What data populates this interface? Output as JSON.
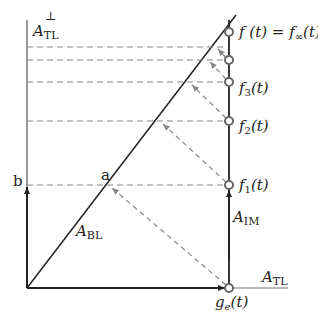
{
  "diagram": {
    "axes": {
      "vertical_label_main": "A",
      "vertical_label_sub": "TL",
      "vertical_label_sup": "⊥",
      "horizontal_label_main": "A",
      "horizontal_label_sub": "TL"
    },
    "lines": {
      "diagonal_label_main": "A",
      "diagonal_label_sub": "BL",
      "right_vertical_label_main": "A",
      "right_vertical_label_sub": "IM"
    },
    "points": {
      "a": "a",
      "b": "b",
      "ge": "g",
      "ge_sub": "e",
      "ge_arg": "(t)",
      "f1": "f",
      "f1_sub": "1",
      "f1_arg": "(t)",
      "f2": "f",
      "f2_sub": "2",
      "f2_arg": "(t)",
      "f3": "f",
      "f3_sub": "3",
      "f3_arg": "(t)",
      "finf_left": "f (t) = f",
      "finf_sub": "∞",
      "finf_arg": "(t)"
    }
  }
}
